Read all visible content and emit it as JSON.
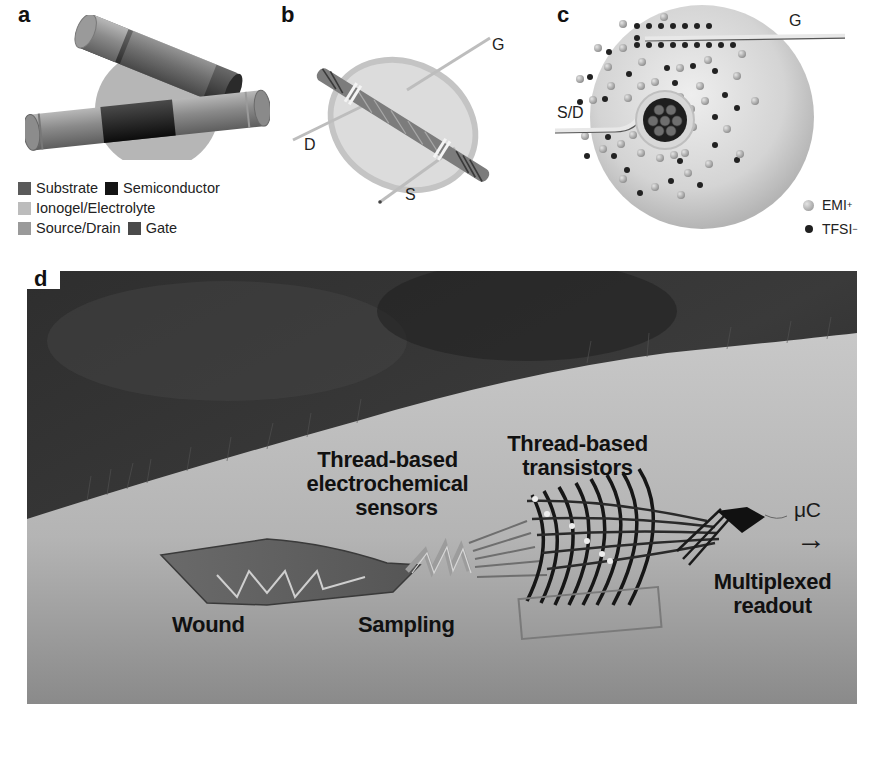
{
  "figure": {
    "panels": [
      {
        "id": "a",
        "label": "a"
      },
      {
        "id": "b",
        "label": "b"
      },
      {
        "id": "c",
        "label": "c"
      },
      {
        "id": "d",
        "label": "d"
      }
    ]
  },
  "panel_a": {
    "label": "a",
    "legend": [
      {
        "name": "Substrate",
        "color": "#5a5a5a"
      },
      {
        "name": "Semiconductor",
        "color": "#141414"
      },
      {
        "name": "Ionogel/Electrolyte",
        "color": "#bcbcbc"
      },
      {
        "name": "Source/Drain",
        "color": "#9a9a9a"
      },
      {
        "name": "Gate",
        "color": "#4a4a4a"
      }
    ]
  },
  "panel_b": {
    "label": "b",
    "terminals": {
      "gate": "G",
      "drain": "D",
      "source": "S"
    }
  },
  "panel_c": {
    "label": "c",
    "terminals": {
      "gate": "G",
      "source_drain": "S/D"
    },
    "legend": [
      {
        "name": "EMI",
        "superscript": "+",
        "color": "#b0b0b0"
      },
      {
        "name": "TFSI",
        "superscript": "−",
        "color": "#202020"
      }
    ]
  },
  "panel_d": {
    "label": "d",
    "labels": {
      "wound": "Wound",
      "sampling": "Sampling",
      "sensors_line1": "Thread-based",
      "sensors_line2": "electrochemical",
      "sensors_line3": "sensors",
      "transistors_line1": "Thread-based",
      "transistors_line2": "transistors",
      "readout_line1": "Multiplexed",
      "readout_line2": "readout",
      "microcontroller": "μC",
      "arrow": "→"
    }
  }
}
